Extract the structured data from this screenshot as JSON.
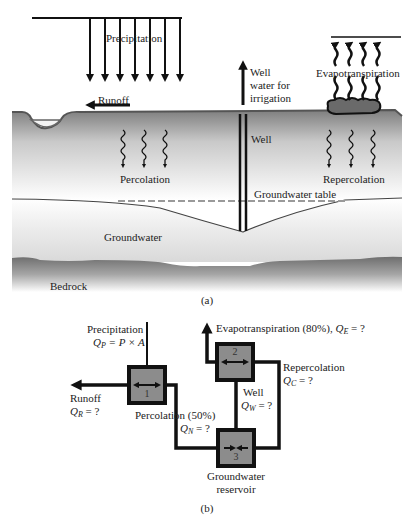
{
  "figure_a": {
    "caption": "(a)",
    "labels": {
      "precipitation": "Precipitation",
      "runoff": "Runoff",
      "well_water_line1": "Well",
      "well_water_line2": "water for",
      "well_water_line3": "irrigation",
      "evapotranspiration": "Evapotranspiration",
      "well": "Well",
      "percolation": "Percolation",
      "repercolation": "Repercolation",
      "groundwater_table": "Groundwater table",
      "groundwater": "Groundwater",
      "bedrock": "Bedrock"
    }
  },
  "figure_b": {
    "caption": "(b)",
    "nodes": [
      {
        "id": "1",
        "label": "1"
      },
      {
        "id": "2",
        "label": "2"
      },
      {
        "id": "3",
        "label": "3",
        "name_line1": "Groundwater",
        "name_line2": "reservoir"
      }
    ],
    "flows": {
      "precipitation": {
        "label": "Precipitation",
        "symbol": "Q",
        "subscript": "P",
        "expr": " = P × A"
      },
      "runoff": {
        "label": "Runoff",
        "symbol": "Q",
        "subscript": "R",
        "expr": " = ?"
      },
      "percolation": {
        "label": "Percolation (50%)",
        "symbol": "Q",
        "subscript": "N",
        "expr": " = ?"
      },
      "evapotranspiration": {
        "label": "Evapotranspiration (80%), ",
        "symbol": "Q",
        "subscript": "E",
        "expr": " = ?"
      },
      "repercolation": {
        "label": "Repercolation",
        "symbol": "Q",
        "subscript": "C",
        "expr": " = ?"
      },
      "well": {
        "label": "Well",
        "symbol": "Q",
        "subscript": "W",
        "expr": " = ?"
      }
    }
  },
  "colors": {
    "ink": "#111111",
    "soil_top": "#8a8a8a",
    "soil_light": "#f4f4f4",
    "groundwater_light": "#f0f0f0",
    "groundwater_dark": "#c8c8c8",
    "bedrock_dark": "#7a7a7a",
    "node_fill": "#8c8c8c",
    "dash": "#999999"
  }
}
